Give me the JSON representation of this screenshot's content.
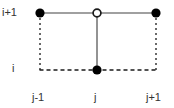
{
  "figure": {
    "width": 174,
    "height": 108,
    "background_color": "#ffffff"
  },
  "labels": {
    "row_upper": "i+1",
    "row_lower": "i",
    "col_left": "j-1",
    "col_center": "j",
    "col_right": "j+1",
    "text_color": "#333333"
  },
  "colors": {
    "solid_line": "#808080",
    "dashed_line": "#1a1a1a",
    "filled_node_fill": "#000000",
    "open_node_fill": "#ffffff",
    "open_node_stroke": "#1a1a1a"
  },
  "geometry": {
    "x_left": 40,
    "x_center": 97,
    "x_right": 156,
    "y_top": 13,
    "y_bottom": 70,
    "filled_node_radius": 4.5,
    "open_node_radius": 4,
    "open_node_stroke_width": 1.6,
    "solid_line_width": 1.6,
    "dashed_line_width": 1.3,
    "dash_pattern_vertical": "2,3",
    "dash_pattern_horizontal": "4,3"
  },
  "nodes": [
    {
      "name": "node-top-left",
      "grid": "(i+1, j-1)",
      "style": "filled",
      "x": 40,
      "y": 13
    },
    {
      "name": "node-top-center",
      "grid": "(i+1, j)",
      "style": "open",
      "x": 97,
      "y": 13
    },
    {
      "name": "node-top-right",
      "grid": "(i+1, j+1)",
      "style": "filled",
      "x": 156,
      "y": 13
    },
    {
      "name": "node-bottom-center",
      "grid": "(i, j)",
      "style": "filled",
      "x": 97,
      "y": 70
    }
  ],
  "edges": [
    {
      "name": "edge-top-left-segment",
      "style": "solid",
      "from": "node-top-left",
      "to": "node-top-center"
    },
    {
      "name": "edge-top-right-segment",
      "style": "solid",
      "from": "node-top-center",
      "to": "node-top-right"
    },
    {
      "name": "edge-center-vertical",
      "style": "solid",
      "from": "node-top-center",
      "to": "node-bottom-center"
    },
    {
      "name": "edge-left-vertical",
      "style": "dashed",
      "from": "node-top-left",
      "to": "grid-corner-bottom-left"
    },
    {
      "name": "edge-right-vertical",
      "style": "dashed",
      "from": "node-top-right",
      "to": "grid-corner-bottom-right"
    },
    {
      "name": "edge-bottom-horizontal",
      "style": "dashed",
      "from": "grid-corner-bottom-left",
      "to": "grid-corner-bottom-right"
    }
  ]
}
